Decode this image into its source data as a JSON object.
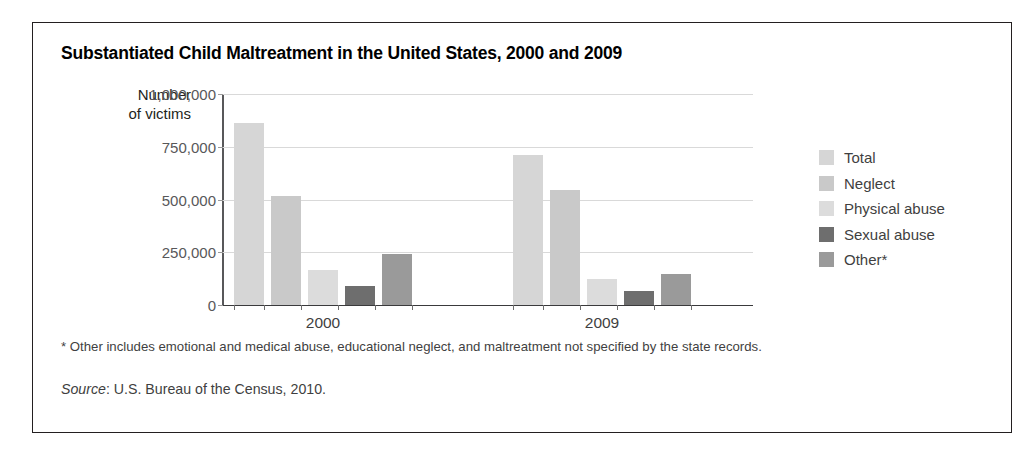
{
  "figure": {
    "title": "Substantiated Child Maltreatment in the United States, 2000 and 2009",
    "footnote": "* Other includes emotional and medical abuse, educational neglect, and maltreatment not specified by the state records.",
    "source_word": "Source",
    "source_rest": ": U.S. Bureau of the Census, 2010."
  },
  "chart_data": {
    "type": "bar",
    "title": "Substantiated Child Maltreatment in the United States, 2000 and 2009",
    "xlabel": "",
    "ylabel": "Number of victims",
    "ylabel_line1": "Number",
    "ylabel_line2": "of victims",
    "categories": [
      "2000",
      "2009"
    ],
    "ylim": [
      0,
      1000000
    ],
    "yticks": [
      0,
      250000,
      500000,
      750000,
      1000000
    ],
    "ytick_labels": [
      "0",
      "250,000",
      "500,000",
      "750,000",
      "1,000,000"
    ],
    "grid": true,
    "legend_position": "right",
    "series": [
      {
        "name": "Total",
        "color": "#d6d6d6",
        "values": [
          865000,
          710000
        ]
      },
      {
        "name": "Neglect",
        "color": "#c9c9c9",
        "values": [
          515000,
          545000
        ]
      },
      {
        "name": "Physical abuse",
        "color": "#dcdcdc",
        "values": [
          166000,
          125000
        ]
      },
      {
        "name": "Sexual abuse",
        "color": "#6e6e6e",
        "values": [
          88000,
          66000
        ]
      },
      {
        "name": "Other*",
        "color": "#9a9a9a",
        "values": [
          240000,
          145000
        ]
      }
    ]
  }
}
